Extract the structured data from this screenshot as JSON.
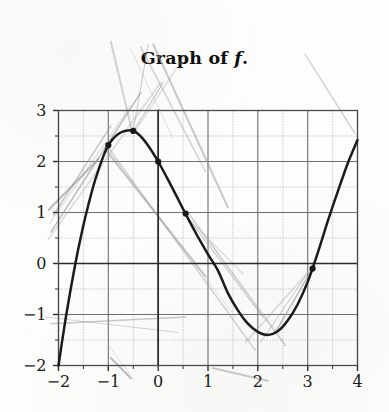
{
  "chart_data": {
    "type": "line",
    "title": "Graph of f.",
    "title_parts": {
      "prefix": "Graph of ",
      "symbol": "f",
      "suffix": "."
    },
    "xlabel": "",
    "ylabel": "",
    "xlim": [
      -2,
      4
    ],
    "ylim": [
      -2,
      3
    ],
    "xticks": [
      -2,
      -1,
      0,
      1,
      2,
      3,
      4
    ],
    "yticks": [
      3,
      2,
      1,
      0,
      -1,
      -2
    ],
    "xtick_labels": [
      "−2",
      "−1",
      "0",
      "1",
      "2",
      "3",
      "4"
    ],
    "ytick_labels": [
      "3",
      "2",
      "1",
      "0",
      "−1",
      "−2"
    ],
    "grid": true,
    "grid_step": 0.5,
    "legend": null,
    "legend_position": "none",
    "axis_lines": {
      "x_axis_at_y": 0,
      "y_axis_at_x": 0
    },
    "series": [
      {
        "name": "f",
        "style": "solid-dark-curve",
        "color": "#1b1b1b",
        "points": [
          [
            -2.0,
            -2.0
          ],
          [
            -1.9,
            -1.35
          ],
          [
            -1.8,
            -0.75
          ],
          [
            -1.7,
            -0.2
          ],
          [
            -1.6,
            0.3
          ],
          [
            -1.5,
            0.75
          ],
          [
            -1.4,
            1.15
          ],
          [
            -1.3,
            1.52
          ],
          [
            -1.2,
            1.83
          ],
          [
            -1.1,
            2.1
          ],
          [
            -1.0,
            2.32
          ],
          [
            -0.9,
            2.45
          ],
          [
            -0.8,
            2.54
          ],
          [
            -0.7,
            2.59
          ],
          [
            -0.6,
            2.61
          ],
          [
            -0.5,
            2.6
          ],
          [
            -0.4,
            2.54
          ],
          [
            -0.3,
            2.44
          ],
          [
            -0.2,
            2.31
          ],
          [
            -0.1,
            2.16
          ],
          [
            0.0,
            2.0
          ],
          [
            0.2,
            1.64
          ],
          [
            0.4,
            1.26
          ],
          [
            0.6,
            0.88
          ],
          [
            0.8,
            0.52
          ],
          [
            1.0,
            0.18
          ],
          [
            1.2,
            -0.14
          ],
          [
            1.4,
            -0.58
          ],
          [
            1.6,
            -0.92
          ],
          [
            1.8,
            -1.18
          ],
          [
            2.0,
            -1.34
          ],
          [
            2.2,
            -1.4
          ],
          [
            2.4,
            -1.33
          ],
          [
            2.6,
            -1.12
          ],
          [
            2.8,
            -0.8
          ],
          [
            3.0,
            -0.36
          ],
          [
            3.2,
            0.2
          ],
          [
            3.4,
            0.82
          ],
          [
            3.6,
            1.4
          ],
          [
            3.8,
            1.95
          ],
          [
            4.0,
            2.42
          ]
        ]
      }
    ],
    "marked_points": [
      {
        "x": -1.0,
        "y": 2.32
      },
      {
        "x": -0.5,
        "y": 2.6
      },
      {
        "x": 0.0,
        "y": 2.0
      },
      {
        "x": 0.55,
        "y": 0.98
      },
      {
        "x": 3.1,
        "y": -0.1
      }
    ],
    "annotations": [
      {
        "kind": "hand-drawn-lines",
        "label": "faint pencil tangent/secant lines overlaid on plot",
        "count": 22
      }
    ]
  },
  "style": {
    "background": "#fdfdfc",
    "grid_minor_color": "#b9b9b9",
    "grid_major_color": "#6f6f6f",
    "axis_color": "#2a2a2a",
    "curve_color": "#1b1b1b",
    "pencil_color": "#9a9a9a",
    "text_color": "#141414"
  }
}
